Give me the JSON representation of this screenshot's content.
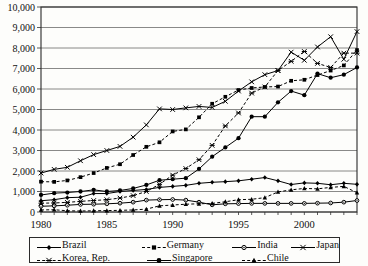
{
  "chart_data": {
    "type": "line",
    "title": "",
    "xlabel": "",
    "ylabel": "",
    "ylim": [
      0,
      10000
    ],
    "xlim": [
      1980,
      2004
    ],
    "grid": true,
    "legend_position": "bottom",
    "ytick_labels": [
      "0",
      "1,000",
      "2,000",
      "3,000",
      "4,000",
      "5,000",
      "6,000",
      "7,000",
      "8,000",
      "9,000",
      "10,000"
    ],
    "ytick_values": [
      0,
      1000,
      2000,
      3000,
      4000,
      5000,
      6000,
      7000,
      8000,
      9000,
      10000
    ],
    "xtick_labels": [
      "1980",
      "1985",
      "1990",
      "1995",
      "2000"
    ],
    "xtick_values": [
      1980,
      1985,
      1990,
      1995,
      2000
    ],
    "x": [
      1980,
      1981,
      1982,
      1983,
      1984,
      1985,
      1986,
      1987,
      1988,
      1989,
      1990,
      1991,
      1992,
      1993,
      1994,
      1995,
      1996,
      1997,
      1998,
      1999,
      2000,
      2001,
      2002,
      2003,
      2004
    ],
    "series": [
      {
        "name": "Brazil",
        "marker": "diamond",
        "dash": "solid",
        "values": [
          550,
          600,
          700,
          720,
          900,
          900,
          1000,
          1050,
          1100,
          1200,
          1250,
          1300,
          1400,
          1450,
          1480,
          1520,
          1600,
          1680,
          1520,
          1340,
          1420,
          1400,
          1330,
          1400,
          1350
        ]
      },
      {
        "name": "Germany",
        "marker": "square",
        "dash": "dashed",
        "values": [
          1480,
          1470,
          1540,
          1700,
          1900,
          2150,
          2330,
          2780,
          3180,
          3400,
          3930,
          4030,
          4620,
          5280,
          5620,
          5950,
          6050,
          6100,
          6120,
          6400,
          6450,
          6680,
          6900,
          7150,
          7900
        ]
      },
      {
        "name": "India",
        "marker": "circle-open",
        "dash": "solid",
        "values": [
          280,
          300,
          330,
          370,
          380,
          400,
          430,
          480,
          580,
          600,
          610,
          580,
          480,
          350,
          400,
          410,
          420,
          420,
          420,
          420,
          420,
          430,
          440,
          480,
          560
        ]
      },
      {
        "name": "Japan",
        "marker": "x-cross",
        "dash": "solid",
        "values": [
          1900,
          2080,
          2180,
          2500,
          2800,
          3000,
          3200,
          3650,
          4250,
          5030,
          5000,
          5080,
          5150,
          5100,
          5400,
          5900,
          6350,
          6700,
          6900,
          7800,
          7400,
          8050,
          8550,
          7450,
          8800
        ]
      },
      {
        "name": "Korea, Rep.",
        "marker": "star-cross",
        "dash": "dashed",
        "values": [
          430,
          440,
          470,
          520,
          560,
          600,
          680,
          800,
          1000,
          1350,
          1800,
          2120,
          2550,
          3250,
          4200,
          4830,
          5800,
          6100,
          6900,
          7350,
          7830,
          7250,
          7050,
          7750,
          7750
        ]
      },
      {
        "name": "Singapore",
        "marker": "circle-filled",
        "dash": "solid",
        "values": [
          830,
          920,
          950,
          1000,
          1080,
          1000,
          1050,
          1150,
          1320,
          1550,
          1600,
          1650,
          2100,
          2700,
          3150,
          3600,
          4650,
          4650,
          5350,
          5900,
          5700,
          6750,
          6550,
          6700,
          7050
        ]
      },
      {
        "name": "Chile",
        "marker": "triangle",
        "dash": "dashed",
        "values": [
          100,
          110,
          60,
          50,
          60,
          70,
          80,
          100,
          140,
          300,
          340,
          380,
          400,
          420,
          500,
          600,
          620,
          700,
          980,
          1080,
          1150,
          1130,
          1200,
          1250,
          940
        ]
      }
    ]
  }
}
